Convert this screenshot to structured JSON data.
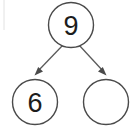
{
  "diagram": {
    "type": "number-bond",
    "canvas": {
      "width": 130,
      "height": 129,
      "background": "#ffffff"
    },
    "style": {
      "circle_stroke": "#4a4a4a",
      "circle_fill": "#ffffff",
      "arrow_color": "#5a5a5a",
      "text_color": "#1c1c1c",
      "edge_rule_color": "#e2e2e2"
    },
    "nodes": [
      {
        "id": "whole",
        "role": "whole",
        "label": "9",
        "empty": false,
        "cx": 71,
        "cy": 25,
        "r": 22.5
      },
      {
        "id": "part-left",
        "role": "part",
        "label": "6",
        "empty": false,
        "cx": 35,
        "cy": 102,
        "r": 22.5
      },
      {
        "id": "part-right",
        "role": "part",
        "label": "",
        "empty": true,
        "cx": 106,
        "cy": 102,
        "r": 22.5
      }
    ],
    "arrows": [
      {
        "id": "arrow-left",
        "from": "whole",
        "to": "part-left",
        "direction": "down-left"
      },
      {
        "id": "arrow-right",
        "from": "whole",
        "to": "part-right",
        "direction": "down-right"
      }
    ]
  }
}
